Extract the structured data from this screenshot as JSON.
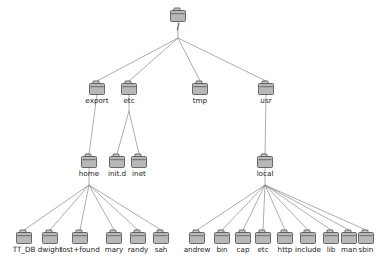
{
  "diagram": {
    "icon_name": "folder-icon",
    "colors": {
      "edge": "#8a8a8a",
      "folder_fill": "#b8b8b8",
      "folder_tab": "#c8c8c8",
      "folder_stroke": "#4a4a4a",
      "label": "#1a1a1a",
      "background": "#ffffff"
    },
    "nodes": [
      {
        "id": "root",
        "label": "/",
        "x": 178,
        "y": 16,
        "level": 0
      },
      {
        "id": "export",
        "label": "export",
        "x": 97,
        "y": 89,
        "level": 1
      },
      {
        "id": "etc",
        "label": "etc",
        "x": 129,
        "y": 89,
        "level": 1
      },
      {
        "id": "tmp",
        "label": "tmp",
        "x": 200,
        "y": 89,
        "level": 1
      },
      {
        "id": "usr",
        "label": "usr",
        "x": 266,
        "y": 89,
        "level": 1
      },
      {
        "id": "home",
        "label": "home",
        "x": 89,
        "y": 162,
        "level": 2
      },
      {
        "id": "init.d",
        "label": "init.d",
        "x": 117,
        "y": 162,
        "level": 2
      },
      {
        "id": "inet",
        "label": "inet",
        "x": 139,
        "y": 162,
        "level": 2
      },
      {
        "id": "local",
        "label": "local",
        "x": 265,
        "y": 162,
        "level": 2
      },
      {
        "id": "TT_DB",
        "label": "TT_DB",
        "x": 24,
        "y": 238,
        "level": 3
      },
      {
        "id": "dwight",
        "label": "dwight",
        "x": 50,
        "y": 238,
        "level": 3
      },
      {
        "id": "lost+found",
        "label": "lost+found",
        "x": 80,
        "y": 238,
        "level": 3
      },
      {
        "id": "mary",
        "label": "mary",
        "x": 114,
        "y": 238,
        "level": 3
      },
      {
        "id": "randy",
        "label": "randy",
        "x": 138,
        "y": 238,
        "level": 3
      },
      {
        "id": "sah",
        "label": "sah",
        "x": 161,
        "y": 238,
        "level": 3
      },
      {
        "id": "andrew",
        "label": "andrew",
        "x": 197,
        "y": 238,
        "level": 3
      },
      {
        "id": "bin",
        "label": "bin",
        "x": 222,
        "y": 238,
        "level": 3
      },
      {
        "id": "cap",
        "label": "cap",
        "x": 243,
        "y": 238,
        "level": 3
      },
      {
        "id": "etc2",
        "label": "etc",
        "x": 263,
        "y": 238,
        "level": 3
      },
      {
        "id": "http",
        "label": "http",
        "x": 285,
        "y": 238,
        "level": 3
      },
      {
        "id": "include",
        "label": "include",
        "x": 308,
        "y": 238,
        "level": 3
      },
      {
        "id": "lib",
        "label": "lib",
        "x": 331,
        "y": 238,
        "level": 3
      },
      {
        "id": "man",
        "label": "man",
        "x": 349,
        "y": 238,
        "level": 3
      },
      {
        "id": "sbin",
        "label": "sbin",
        "x": 366,
        "y": 238,
        "level": 3
      }
    ],
    "fanout_points": [
      {
        "id": "root-fan",
        "x": 178,
        "y": 38
      },
      {
        "id": "etc-fan",
        "x": 129,
        "y": 111
      },
      {
        "id": "home-fan",
        "x": 89,
        "y": 185
      },
      {
        "id": "local-fan",
        "x": 265,
        "y": 185
      }
    ],
    "edges": [
      {
        "from": "root",
        "to": "root-fan"
      },
      {
        "from": "root-fan",
        "to": "export"
      },
      {
        "from": "root-fan",
        "to": "etc"
      },
      {
        "from": "root-fan",
        "to": "tmp"
      },
      {
        "from": "root-fan",
        "to": "usr"
      },
      {
        "from": "export",
        "to": "home"
      },
      {
        "from": "etc",
        "to": "etc-fan"
      },
      {
        "from": "etc-fan",
        "to": "init.d"
      },
      {
        "from": "etc-fan",
        "to": "inet"
      },
      {
        "from": "usr",
        "to": "local"
      },
      {
        "from": "home",
        "to": "home-fan"
      },
      {
        "from": "home-fan",
        "to": "TT_DB"
      },
      {
        "from": "home-fan",
        "to": "dwight"
      },
      {
        "from": "home-fan",
        "to": "lost+found"
      },
      {
        "from": "home-fan",
        "to": "mary"
      },
      {
        "from": "home-fan",
        "to": "randy"
      },
      {
        "from": "home-fan",
        "to": "sah"
      },
      {
        "from": "local",
        "to": "local-fan"
      },
      {
        "from": "local-fan",
        "to": "andrew"
      },
      {
        "from": "local-fan",
        "to": "bin"
      },
      {
        "from": "local-fan",
        "to": "cap"
      },
      {
        "from": "local-fan",
        "to": "etc2"
      },
      {
        "from": "local-fan",
        "to": "http"
      },
      {
        "from": "local-fan",
        "to": "include"
      },
      {
        "from": "local-fan",
        "to": "lib"
      },
      {
        "from": "local-fan",
        "to": "man"
      },
      {
        "from": "local-fan",
        "to": "sbin"
      }
    ]
  }
}
